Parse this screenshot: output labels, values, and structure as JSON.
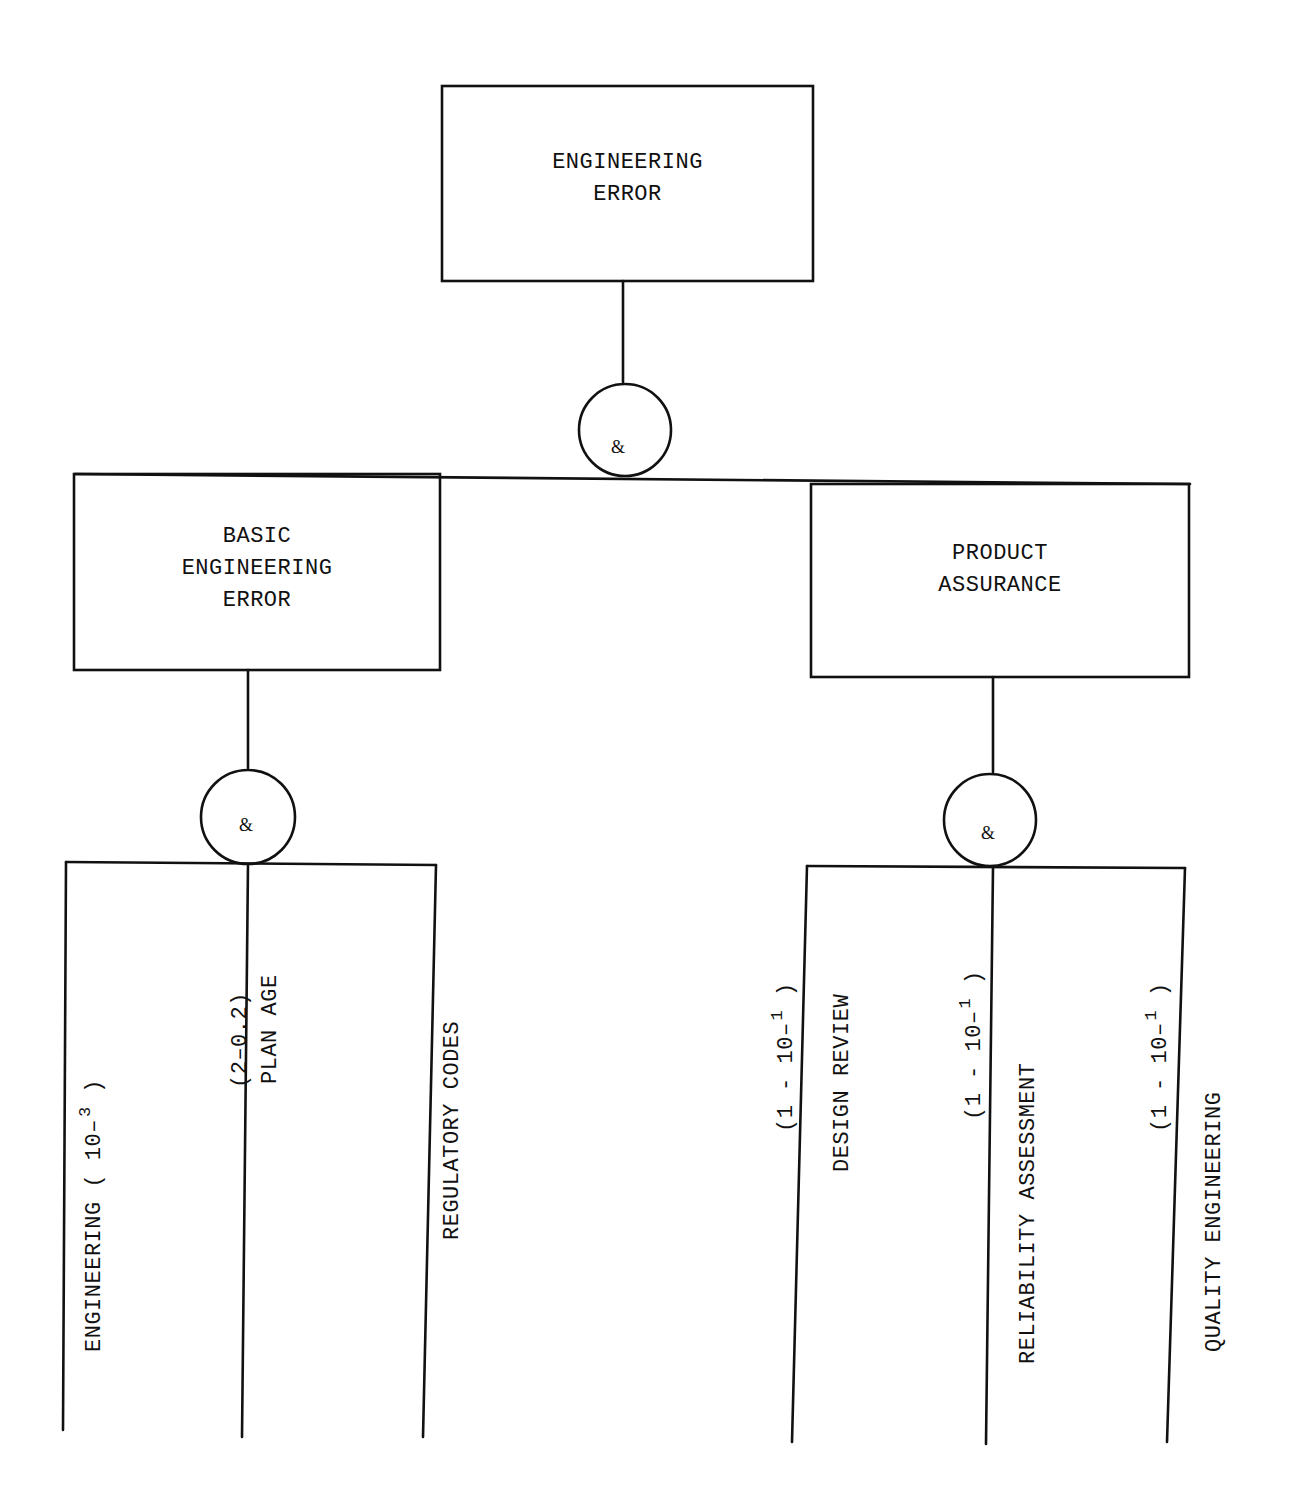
{
  "diagram": {
    "type": "fault-tree",
    "line_color": "#111111",
    "background": "#ffffff",
    "top_event": {
      "line1": "ENGINEERING",
      "line2": "ERROR"
    },
    "top_gate": {
      "symbol": "&"
    },
    "intermediate_events": {
      "left": {
        "line1": "BASIC",
        "line2": "ENGINEERING",
        "line3": "ERROR"
      },
      "right": {
        "line1": "PRODUCT",
        "line2": "ASSURANCE"
      }
    },
    "left_gate": {
      "symbol": "&"
    },
    "right_gate": {
      "symbol": "&"
    },
    "basic_events": {
      "engineering": {
        "label": "ENGINEERING",
        "value_prefix": "( 10–",
        "value_exp": "3",
        "value_suffix": " )"
      },
      "plan_age": {
        "label": "PLAN AGE",
        "value": "(2–0.2)"
      },
      "regulatory_codes": {
        "label": "REGULATORY CODES"
      },
      "design_review": {
        "label": "DESIGN REVIEW",
        "value_prefix": "(1  -  10–",
        "value_exp": "1",
        "value_suffix": " )"
      },
      "reliability_assessment": {
        "label": "RELIABILITY ASSESSMENT",
        "value_prefix": "(1  -  10–",
        "value_exp": "1",
        "value_suffix": " )"
      },
      "quality_engineering": {
        "label": "QUALITY ENGINEERING",
        "value_prefix": "(1  -  10–",
        "value_exp": "1",
        "value_suffix": " )"
      }
    }
  }
}
